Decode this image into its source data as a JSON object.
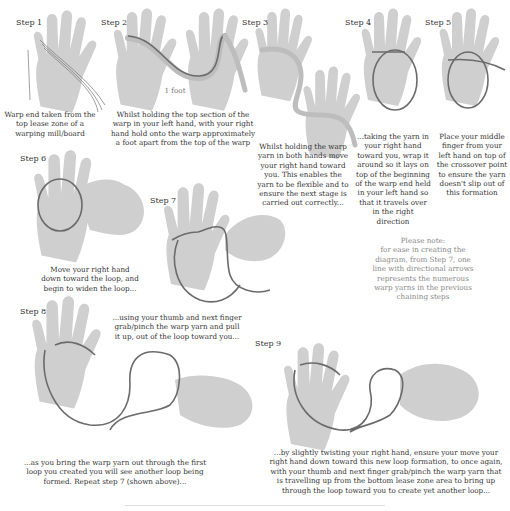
{
  "diagram": {
    "type": "instructional-illustration"
  },
  "steps": [
    {
      "label": "Step 1",
      "caption": "Warp end taken from the top lease zone of a warping mill/board"
    },
    {
      "label": "Step 2",
      "caption": "Whilst holding the top section of the warp in your left hand, with your right hand hold onto the warp approximately a foot apart from the top of the warp",
      "measure_label": "1 foot"
    },
    {
      "label": "Step 3",
      "caption": "Whilst holding the warp yarn in both hands move your right hand toward you. This enables the yarn to be flexible and to ensure the next stage is carried out correctly..."
    },
    {
      "label": "Step 4",
      "caption": "...taking the yarn in your right hand toward you, wrap it around so it lays on top of the beginning of the warp end held in your left hand so that it travels over in the right direction"
    },
    {
      "label": "Step 5",
      "caption": "Place your middle finger from your left hand on top of the crossover point to ensure the yarn doesn't slip out of this formation"
    },
    {
      "label": "Step 6",
      "caption": "Move your right hand down toward the loop, and begin to widen the loop..."
    },
    {
      "label": "Step 7",
      "caption": "...using your thumb and next finger grab/pinch the warp yarn and pull it up, out of the loop toward you..."
    },
    {
      "label": "Step 8",
      "caption": "...as you bring the warp yarn out through the first loop you created you will see another loop being formed. Repeat step 7 (shown above)..."
    },
    {
      "label": "Step 9",
      "caption": "...by slightly twisting your right hand, ensure your move your right hand down toward this new loop formation, to once again, with your thumb and next finger grab/pinch the warp yarn that is travelling up from the bottom lease zone area to bring up through the loop toward you to create yet another loop..."
    }
  ],
  "note": {
    "title": "Please note:",
    "body": "for ease in creating the diagram, from Step 7, one line with directional arrows represents the numerous warp yarns in the previous chaining steps"
  },
  "colors": {
    "hand": "#cfcfcf",
    "yarn": "#6b6b6b",
    "band": "#bdbdbd",
    "text": "#333333",
    "note_text": "#888888"
  }
}
